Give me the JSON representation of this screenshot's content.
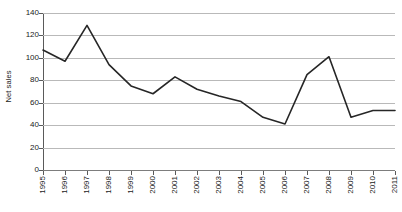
{
  "chart_data": {
    "type": "line",
    "title": "",
    "subtitle": "",
    "xlabel": "",
    "ylabel": "Net sales",
    "x": [
      1995,
      1996,
      1997,
      1998,
      1999,
      2000,
      2001,
      2002,
      2003,
      2004,
      2005,
      2006,
      2007,
      2008,
      2009,
      2010,
      2011
    ],
    "categories": [
      "1995",
      "1996",
      "1997",
      "1998",
      "1999",
      "2000",
      "2001",
      "2002",
      "2003",
      "2004",
      "2005",
      "2006",
      "2007",
      "2008",
      "2009",
      "2010",
      "2011"
    ],
    "values": [
      107,
      97,
      129,
      94,
      75,
      68,
      83,
      72,
      66,
      61,
      47,
      41,
      85,
      101,
      47,
      53,
      53
    ],
    "series": [
      {
        "name": "Net sales",
        "values": [
          107,
          97,
          129,
          94,
          75,
          68,
          83,
          72,
          66,
          61,
          47,
          41,
          85,
          101,
          47,
          53,
          53
        ]
      }
    ],
    "ylim": [
      0,
      140
    ],
    "yticks": [
      0,
      20,
      40,
      60,
      80,
      100,
      120,
      140
    ],
    "ytick_labels": [
      "0",
      "20",
      "40",
      "60",
      "80",
      "100",
      "120",
      "140"
    ],
    "xtick_labels": [
      "1995",
      "1996",
      "1997",
      "1998",
      "1999",
      "2000",
      "2001",
      "2002",
      "2003",
      "2004",
      "2005",
      "2006",
      "2007",
      "2008",
      "2009",
      "2010",
      "2011"
    ],
    "xtick_rotation": -90,
    "grid": {
      "horizontal": true,
      "vertical": false
    },
    "legend": {
      "visible": false,
      "position": "none",
      "entries": []
    },
    "annotations": [],
    "colors": {
      "line": "#262626",
      "gridline": "#b9b9b9",
      "axis": "#5a5a5a",
      "background": "#ffffff",
      "text": "#1a1a1a"
    },
    "line_width": 1.6,
    "markers": "none"
  }
}
